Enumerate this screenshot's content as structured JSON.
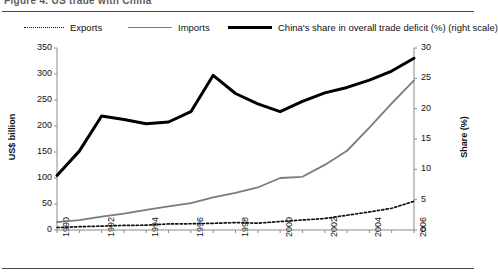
{
  "figure": {
    "caption_partial": "Figure 4.  US trade with China",
    "legend": [
      {
        "label": "Exports",
        "key": "dotted-line-key",
        "color": "#111111"
      },
      {
        "label": "Imports",
        "key": "gray-line-key",
        "color": "#7b7b7b"
      },
      {
        "label": "China's share in overall trade deficit (%) (right scale)",
        "key": "black-line-key",
        "color": "#000000"
      }
    ]
  },
  "chart_data": {
    "type": "line",
    "title": "",
    "xlabel": "",
    "ylabel": "US$ billion",
    "y2label": "Share (%)",
    "x": [
      1990,
      1991,
      1992,
      1993,
      1994,
      1995,
      1996,
      1997,
      1998,
      1999,
      2000,
      2001,
      2002,
      2003,
      2004,
      2005,
      2006
    ],
    "xtick_labels": [
      "1990",
      "1992",
      "1994",
      "1996",
      "1998",
      "2000",
      "2002",
      "2004",
      "2006"
    ],
    "xtick_values": [
      1990,
      1992,
      1994,
      1996,
      1998,
      2000,
      2002,
      2004,
      2006
    ],
    "xlim": [
      1990,
      2006
    ],
    "ylim": [
      0,
      350
    ],
    "ytick_values": [
      0,
      50,
      100,
      150,
      200,
      250,
      300,
      350
    ],
    "y2lim": [
      0,
      30
    ],
    "y2tick_values": [
      0,
      5,
      10,
      15,
      20,
      25,
      30
    ],
    "grid": false,
    "legend_position": "top",
    "series": [
      {
        "name": "Exports",
        "axis": "left",
        "unit": "US$ billion",
        "style": "dotted",
        "color": "#111111",
        "values": [
          4.8,
          6.3,
          7.5,
          8.8,
          9.3,
          11.7,
          12.0,
          12.8,
          14.3,
          13.1,
          16.3,
          19.2,
          22.1,
          28.4,
          34.7,
          41.8,
          55.2
        ]
      },
      {
        "name": "Imports",
        "axis": "left",
        "unit": "US$ billion",
        "style": "solid",
        "color": "#7b7b7b",
        "values": [
          15.2,
          19.0,
          25.7,
          31.5,
          38.8,
          45.6,
          51.5,
          62.6,
          71.2,
          81.8,
          100.0,
          102.3,
          125.2,
          152.4,
          196.7,
          243.5,
          287.8
        ]
      },
      {
        "name": "China's share in overall trade deficit (%) (right scale)",
        "axis": "right",
        "unit": "%",
        "style": "solid-thick",
        "color": "#000000",
        "values": [
          9.0,
          13.0,
          18.8,
          18.2,
          17.5,
          17.8,
          19.5,
          25.5,
          22.5,
          20.8,
          19.5,
          21.2,
          22.6,
          23.5,
          24.7,
          26.2,
          28.3
        ]
      }
    ]
  },
  "axes": {
    "left_title": "US$ billion",
    "right_title": "Share (%)"
  }
}
